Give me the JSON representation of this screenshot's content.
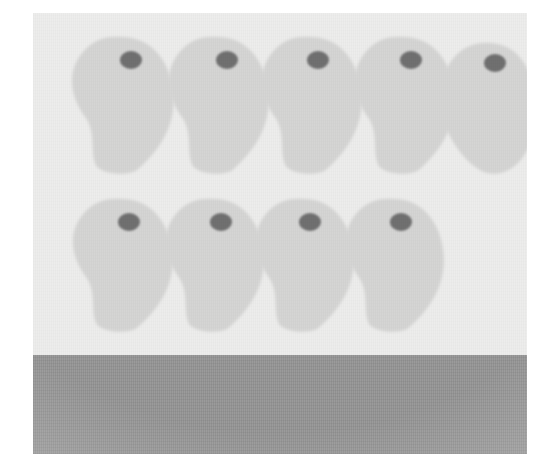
{
  "figure": {
    "type": "specimen-array-illustration",
    "caption": "",
    "background_color": "#ededec",
    "plate": {
      "x": 33,
      "y": 13,
      "width": 494,
      "height": 441
    },
    "page_background_color": "#ffffff"
  },
  "palette": {
    "plate_background": "#ededec",
    "specimen_fill": "#d5d5d4",
    "specimen_fill_shadow": "#cdcdcb",
    "nucleus_dot": "#6f6f6f",
    "base_band": "#979797"
  },
  "base_band": {
    "label": "base-band",
    "color": "#979797",
    "x": 0,
    "y": 342,
    "width": 494,
    "height": 99
  },
  "specimens": {
    "total_count": 9,
    "rows": [
      {
        "row_label": "row-1",
        "count": 5,
        "items": [
          {
            "id": "specimen-1",
            "cx": 88,
            "cy": 92,
            "rx": 56,
            "ry": 68,
            "dot_cx": 98,
            "dot_cy": 47,
            "dot_rx": 11,
            "dot_ry": 9,
            "tail_lean": -1,
            "shape": "teardrop"
          },
          {
            "id": "specimen-2",
            "cx": 184,
            "cy": 92,
            "rx": 55,
            "ry": 68,
            "dot_cx": 194,
            "dot_cy": 47,
            "dot_rx": 11,
            "dot_ry": 9,
            "tail_lean": -1,
            "shape": "teardrop"
          },
          {
            "id": "specimen-3",
            "cx": 277,
            "cy": 92,
            "rx": 55,
            "ry": 68,
            "dot_cx": 285,
            "dot_cy": 47,
            "dot_rx": 11,
            "dot_ry": 9,
            "tail_lean": -1,
            "shape": "teardrop"
          },
          {
            "id": "specimen-4",
            "cx": 370,
            "cy": 92,
            "rx": 55,
            "ry": 68,
            "dot_cx": 378,
            "dot_cy": 47,
            "dot_rx": 11,
            "dot_ry": 9,
            "tail_lean": -1,
            "shape": "teardrop"
          },
          {
            "id": "specimen-5",
            "cx": 458,
            "cy": 96,
            "rx": 52,
            "ry": 66,
            "dot_cx": 462,
            "dot_cy": 50,
            "dot_rx": 11,
            "dot_ry": 9,
            "tail_lean": 0,
            "shape": "ovoid"
          }
        ]
      },
      {
        "row_label": "row-2",
        "count": 4,
        "items": [
          {
            "id": "specimen-6",
            "cx": 88,
            "cy": 252,
            "rx": 55,
            "ry": 66,
            "dot_cx": 96,
            "dot_cy": 209,
            "dot_rx": 11,
            "dot_ry": 9,
            "tail_lean": -1,
            "shape": "teardrop"
          },
          {
            "id": "specimen-7",
            "cx": 180,
            "cy": 252,
            "rx": 54,
            "ry": 66,
            "dot_cx": 188,
            "dot_cy": 209,
            "dot_rx": 11,
            "dot_ry": 9,
            "tail_lean": -1,
            "shape": "teardrop"
          },
          {
            "id": "specimen-8",
            "cx": 270,
            "cy": 252,
            "rx": 54,
            "ry": 66,
            "dot_cx": 277,
            "dot_cy": 209,
            "dot_rx": 11,
            "dot_ry": 9,
            "tail_lean": -1,
            "shape": "teardrop"
          },
          {
            "id": "specimen-9",
            "cx": 360,
            "cy": 252,
            "rx": 54,
            "ry": 66,
            "dot_cx": 368,
            "dot_cy": 209,
            "dot_rx": 11,
            "dot_ry": 9,
            "tail_lean": -1,
            "shape": "teardrop"
          }
        ]
      }
    ]
  }
}
